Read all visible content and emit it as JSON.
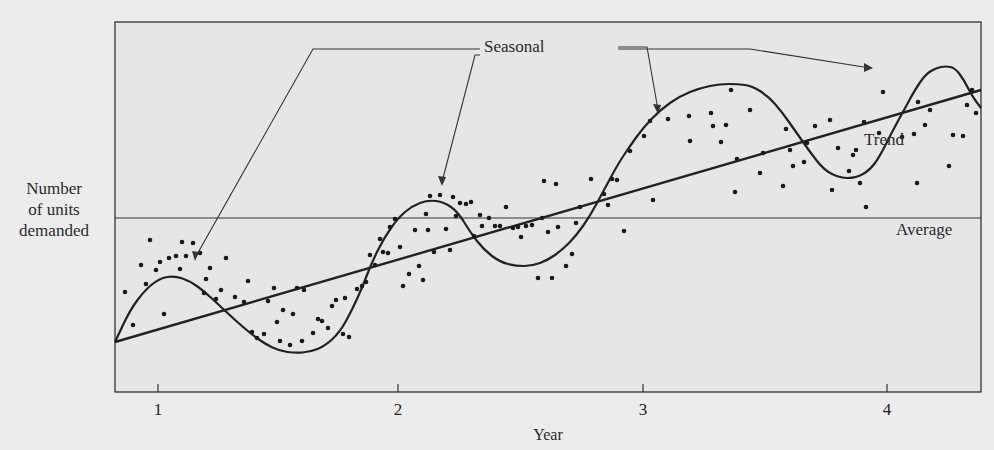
{
  "chart_data": {
    "type": "scatter",
    "title": "",
    "xlabel": "Year",
    "ylabel": "Number of units demanded",
    "xticks": [
      "1",
      "2",
      "3",
      "4"
    ],
    "grid": false,
    "legend": "none (inline annotations)",
    "annotations": {
      "seasonal": "Seasonal",
      "trend": "Trend",
      "average": "Average"
    },
    "series": [
      {
        "name": "Average",
        "type": "line",
        "description": "Horizontal line at constant average demand",
        "points_px": [
          [
            115,
            218
          ],
          [
            981,
            218
          ]
        ]
      },
      {
        "name": "Trend",
        "type": "line",
        "description": "Upward-sloping linear trend",
        "points_px": [
          [
            115,
            342
          ],
          [
            981,
            90
          ]
        ]
      },
      {
        "name": "Seasonal",
        "type": "curve",
        "description": "Sinusoid oscillating around the trend line, peaking mid-year roughly once per year",
        "points_px": [
          [
            115,
            342
          ],
          [
            130,
            310
          ],
          [
            145,
            290
          ],
          [
            160,
            278
          ],
          [
            175,
            276
          ],
          [
            190,
            281
          ],
          [
            205,
            292
          ],
          [
            220,
            306
          ],
          [
            235,
            320
          ],
          [
            250,
            333
          ],
          [
            265,
            344
          ],
          [
            280,
            351
          ],
          [
            295,
            353
          ],
          [
            310,
            352
          ],
          [
            325,
            346
          ],
          [
            340,
            332
          ],
          [
            352,
            310
          ],
          [
            362,
            288
          ],
          [
            372,
            262
          ],
          [
            384,
            238
          ],
          [
            398,
            218
          ],
          [
            412,
            206
          ],
          [
            428,
            200
          ],
          [
            444,
            202
          ],
          [
            458,
            212
          ],
          [
            470,
            232
          ],
          [
            484,
            250
          ],
          [
            500,
            262
          ],
          [
            516,
            266
          ],
          [
            532,
            266
          ],
          [
            548,
            260
          ],
          [
            562,
            250
          ],
          [
            576,
            236
          ],
          [
            590,
            216
          ],
          [
            604,
            190
          ],
          [
            618,
            164
          ],
          [
            630,
            146
          ],
          [
            643,
            128
          ],
          [
            660,
            110
          ],
          [
            680,
            96
          ],
          [
            700,
            88
          ],
          [
            720,
            84
          ],
          [
            738,
            84
          ],
          [
            752,
            86
          ],
          [
            768,
            96
          ],
          [
            782,
            112
          ],
          [
            796,
            132
          ],
          [
            810,
            152
          ],
          [
            824,
            170
          ],
          [
            840,
            178
          ],
          [
            856,
            178
          ],
          [
            870,
            170
          ],
          [
            880,
            156
          ],
          [
            892,
            132
          ],
          [
            904,
            110
          ],
          [
            916,
            88
          ],
          [
            926,
            74
          ],
          [
            936,
            68
          ],
          [
            946,
            66
          ],
          [
            955,
            68
          ],
          [
            964,
            80
          ],
          [
            972,
            96
          ],
          [
            981,
            108
          ]
        ]
      },
      {
        "name": "Observed demand",
        "type": "scatter",
        "points_px": [
          [
            125,
            292
          ],
          [
            133,
            325
          ],
          [
            141,
            265
          ],
          [
            146,
            284
          ],
          [
            150,
            240
          ],
          [
            156,
            270
          ],
          [
            160,
            262
          ],
          [
            164,
            314
          ],
          [
            169,
            258
          ],
          [
            176,
            256
          ],
          [
            180,
            269
          ],
          [
            182,
            242
          ],
          [
            186,
            256
          ],
          [
            193,
            243
          ],
          [
            200,
            253
          ],
          [
            204,
            293
          ],
          [
            206,
            279
          ],
          [
            210,
            268
          ],
          [
            216,
            299
          ],
          [
            221,
            290
          ],
          [
            226,
            258
          ],
          [
            235,
            297
          ],
          [
            244,
            302
          ],
          [
            248,
            281
          ],
          [
            252,
            332
          ],
          [
            257,
            338
          ],
          [
            264,
            334
          ],
          [
            268,
            301
          ],
          [
            274,
            288
          ],
          [
            277,
            322
          ],
          [
            280,
            341
          ],
          [
            283,
            310
          ],
          [
            290,
            345
          ],
          [
            293,
            314
          ],
          [
            297,
            288
          ],
          [
            302,
            341
          ],
          [
            304,
            290
          ],
          [
            313,
            333
          ],
          [
            318,
            319
          ],
          [
            322,
            321
          ],
          [
            328,
            328
          ],
          [
            332,
            306
          ],
          [
            336,
            300
          ],
          [
            343,
            334
          ],
          [
            345,
            298
          ],
          [
            349,
            337
          ],
          [
            357,
            289
          ],
          [
            362,
            286
          ],
          [
            366,
            282
          ],
          [
            370,
            255
          ],
          [
            375,
            265
          ],
          [
            380,
            239
          ],
          [
            383,
            252
          ],
          [
            388,
            253
          ],
          [
            390,
            227
          ],
          [
            395,
            219
          ],
          [
            400,
            247
          ],
          [
            403,
            286
          ],
          [
            409,
            274
          ],
          [
            415,
            230
          ],
          [
            419,
            266
          ],
          [
            423,
            280
          ],
          [
            426,
            214
          ],
          [
            428,
            230
          ],
          [
            430,
            196
          ],
          [
            434,
            252
          ],
          [
            440,
            195
          ],
          [
            446,
            229
          ],
          [
            450,
            250
          ],
          [
            453,
            197
          ],
          [
            456,
            216
          ],
          [
            460,
            203
          ],
          [
            466,
            204
          ],
          [
            471,
            202
          ],
          [
            474,
            236
          ],
          [
            480,
            215
          ],
          [
            482,
            226
          ],
          [
            489,
            218
          ],
          [
            495,
            226
          ],
          [
            500,
            226
          ],
          [
            506,
            207
          ],
          [
            513,
            228
          ],
          [
            518,
            227
          ],
          [
            521,
            237
          ],
          [
            526,
            226
          ],
          [
            532,
            225
          ],
          [
            538,
            278
          ],
          [
            542,
            218
          ],
          [
            544,
            181
          ],
          [
            548,
            232
          ],
          [
            552,
            278
          ],
          [
            556,
            184
          ],
          [
            558,
            227
          ],
          [
            566,
            266
          ],
          [
            572,
            254
          ],
          [
            576,
            223
          ],
          [
            580,
            207
          ],
          [
            591,
            179
          ],
          [
            604,
            194
          ],
          [
            608,
            205
          ],
          [
            612,
            179
          ],
          [
            617,
            180
          ],
          [
            624,
            231
          ],
          [
            630,
            151
          ],
          [
            644,
            136
          ],
          [
            650,
            121
          ],
          [
            653,
            200
          ],
          [
            668,
            119
          ],
          [
            689,
            116
          ],
          [
            690,
            141
          ],
          [
            711,
            113
          ],
          [
            713,
            126
          ],
          [
            721,
            142
          ],
          [
            726,
            125
          ],
          [
            731,
            90
          ],
          [
            735,
            192
          ],
          [
            737,
            159
          ],
          [
            750,
            110
          ],
          [
            760,
            173
          ],
          [
            763,
            153
          ],
          [
            783,
            186
          ],
          [
            786,
            129
          ],
          [
            790,
            150
          ],
          [
            793,
            166
          ],
          [
            804,
            162
          ],
          [
            807,
            143
          ],
          [
            815,
            126
          ],
          [
            830,
            120
          ],
          [
            832,
            190
          ],
          [
            838,
            148
          ],
          [
            849,
            171
          ],
          [
            853,
            155
          ],
          [
            856,
            150
          ],
          [
            860,
            183
          ],
          [
            864,
            122
          ],
          [
            866,
            207
          ],
          [
            879,
            133
          ],
          [
            883,
            92
          ],
          [
            902,
            137
          ],
          [
            918,
            102
          ],
          [
            914,
            134
          ],
          [
            917,
            183
          ],
          [
            925,
            125
          ],
          [
            930,
            110
          ],
          [
            949,
            166
          ],
          [
            953,
            135
          ],
          [
            963,
            136
          ],
          [
            967,
            105
          ],
          [
            972,
            90
          ],
          [
            976,
            113
          ]
        ]
      }
    ],
    "axis_px": {
      "left": 115,
      "right": 981,
      "top": 22,
      "bottom": 392
    },
    "xtick_px": [
      158,
      398,
      643,
      887
    ]
  },
  "labels": {
    "ylabel_lines": [
      "Number",
      "of units",
      "demanded"
    ],
    "xlabel": "Year",
    "seasonal": "Seasonal",
    "trend": "Trend",
    "average": "Average",
    "ticks": [
      "1",
      "2",
      "3",
      "4"
    ]
  }
}
